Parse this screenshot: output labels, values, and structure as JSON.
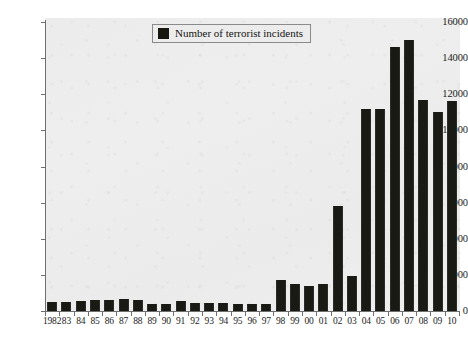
{
  "chart_data": {
    "type": "bar",
    "title": "",
    "xlabel": "",
    "ylabel": "",
    "ylim": [
      0,
      16000
    ],
    "grid": false,
    "legend_position": "top-center",
    "legend": [
      "Number of terrorist incidents"
    ],
    "y_ticks": [
      0,
      2000,
      4000,
      6000,
      8000,
      10000,
      12000,
      14000,
      16000
    ],
    "categories": [
      "1982",
      "83",
      "84",
      "85",
      "86",
      "87",
      "88",
      "89",
      "90",
      "91",
      "92",
      "93",
      "94",
      "95",
      "96",
      "97",
      "98",
      "99",
      "00",
      "01",
      "02",
      "03",
      "04",
      "05",
      "06",
      "07",
      "08",
      "09",
      "10"
    ],
    "full_years": [
      1982,
      1983,
      1984,
      1985,
      1986,
      1987,
      1988,
      1989,
      1990,
      1991,
      1992,
      1993,
      1994,
      1995,
      1996,
      1997,
      1998,
      1999,
      2000,
      2001,
      2002,
      2003,
      2004,
      2005,
      2006,
      2007,
      2008,
      2009,
      2010
    ],
    "series": [
      {
        "name": "Number of terrorist incidents",
        "color": "#1a1a14",
        "values": [
          500,
          500,
          560,
          620,
          620,
          660,
          600,
          380,
          360,
          560,
          420,
          470,
          420,
          400,
          360,
          400,
          1700,
          1500,
          1400,
          1500,
          5800,
          1950,
          11200,
          11200,
          14600,
          15000,
          11700,
          11000,
          11600
        ]
      }
    ]
  },
  "legend": {
    "label": "Number of terrorist incidents"
  },
  "colors": {
    "bar": "#1a1a14",
    "axis": "#6f6f6f",
    "plot_background": "#ececec",
    "text": "#1b1b1b"
  }
}
